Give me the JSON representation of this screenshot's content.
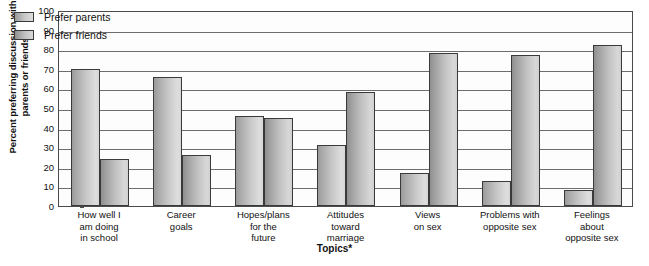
{
  "chart_data": {
    "type": "bar",
    "title": "",
    "xlabel": "Topics*",
    "ylabel": "Percent preferring discussion with parents or friends",
    "ylabel_lines": [
      "Percent preferring discussion with",
      "parents or friends"
    ],
    "ylim": [
      0,
      100
    ],
    "yticks": [
      0,
      10,
      20,
      30,
      40,
      50,
      60,
      70,
      80,
      90,
      100
    ],
    "grid": true,
    "legend_position": "top-left-inside",
    "categories": [
      "How well I am doing in school",
      "Career goals",
      "Hopes/plans for the future",
      "Attitudes toward marriage",
      "Views on sex",
      "Problems with opposite sex",
      "Feelings about opposite sex"
    ],
    "category_lines": [
      [
        "How well I",
        "am doing",
        "in school"
      ],
      [
        "Career",
        "goals"
      ],
      [
        "Hopes/plans",
        "for the",
        "future"
      ],
      [
        "Attitudes",
        "toward",
        "marriage"
      ],
      [
        "Views",
        "on sex"
      ],
      [
        "Problems with",
        "opposite sex"
      ],
      [
        "Feelings",
        "about",
        "opposite sex"
      ]
    ],
    "series": [
      {
        "name": "Prefer parents",
        "color": "#c9c9c9",
        "values": [
          70,
          66,
          46,
          31,
          17,
          13,
          8
        ]
      },
      {
        "name": "Prefer friends",
        "color": "#c2c2c2",
        "values": [
          24,
          26,
          45,
          58,
          78,
          77,
          82
        ]
      }
    ]
  },
  "legend": {
    "items": [
      {
        "label": "Prefer parents",
        "key": "parents"
      },
      {
        "label": "Prefer friends",
        "key": "friends"
      }
    ]
  },
  "axis": {
    "x_title": "Topics*",
    "y_title_line1": "Percent preferring discussion with",
    "y_title_line2": "parents or friends"
  },
  "footnote": ""
}
